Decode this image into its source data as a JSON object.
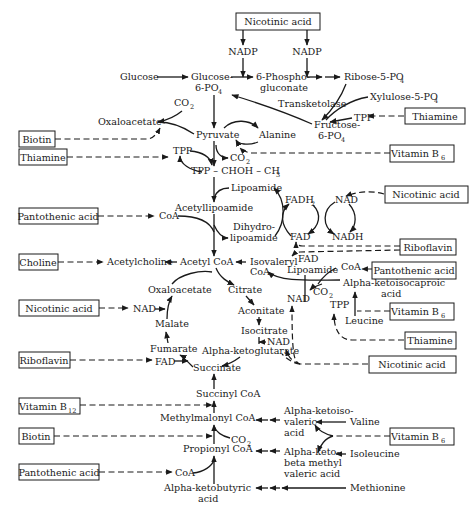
{
  "diagram": {
    "colors": {
      "ink": "#1a1a1a",
      "background": "#ffffff"
    }
  },
  "vitamins": {
    "nicotinic_top": "Nicotinic acid",
    "thiamine_right": "Thiamine",
    "biotin_top": "Biotin",
    "thiamine_left": "Thiamine",
    "vitamin_b6_top": "Vitamin B",
    "vitamin_b6_top_sub": "6",
    "nicotinic_mid": "Nicotinic acid",
    "pantothenic_top": "Pantothenic acid",
    "riboflavin_mid": "Riboflavin",
    "choline": "Choline",
    "pantothenic_right": "Pantothenic acid",
    "nicotinic_left": "Nicotinic acid",
    "vitamin_b6_mid": "Vitamin B",
    "vitamin_b6_mid_sub": "6",
    "thiamine_low": "Thiamine",
    "riboflavin_left": "Riboflavin",
    "nicotinic_low": "Nicotinic acid",
    "vitamin_b12": "Vitamin B",
    "vitamin_b12_sub": "12",
    "biotin_low": "Biotin",
    "vitamin_b6_low": "Vitamin B",
    "vitamin_b6_low_sub": "6",
    "pantothenic_low": "Pantothenic acid"
  },
  "metabolites": {
    "nadp_1": "NADP",
    "nadp_2": "NADP",
    "glucose": "Glucose",
    "glucose6p_1": "Glucose-",
    "glucose6p_2": "6-PO",
    "glucose6p_sub": "4",
    "phosphogluconate_1": "6-Phospho-",
    "phosphogluconate_2": "gluconate",
    "ribose5p": "Ribose-5-PO",
    "ribose5p_sub": "4",
    "xylulose5p": "Xylulose-5-PO",
    "xylulose5p_sub": "4",
    "transketolase": "Transketolase",
    "co2_top": "CO",
    "co2_top_sub": "2",
    "oxaloacetate_top": "Oxaloacetate",
    "tpp_right": "TPP",
    "fructose6p_1": "Fructose-",
    "fructose6p_2": "6-PO",
    "fructose6p_sub": "4",
    "pyruvate": "Pyruvate",
    "alanine": "Alanine",
    "tpp_left": "TPP",
    "co2_pyr": "CO",
    "co2_pyr_sub": "2",
    "tpp_chohch3": "TPP – CHOH – CH",
    "tpp_chohch3_sub": "3",
    "lipoamide_top": "Lipoamide",
    "fadh2": "FADH",
    "fadh2_sub": "2",
    "nad_cycle": "NAD",
    "coa_left": "CoA",
    "acetyllipoamide": "Acetyllipoamide",
    "dihydro_1": "Dihydro-",
    "dihydro_2": "lipoamide",
    "fad_cycle": "FAD",
    "nadh": "NADH",
    "acetylcholine": "Acetylcholine",
    "acetyl_coa": "Acetyl CoA",
    "isovaleryl_1": "Isovaleryl",
    "isovaleryl_2": "CoA",
    "fad_iso": "FAD",
    "lipoamide_iso": "Lipoamide",
    "coa_right": "CoA",
    "alpha_ketoisocaproic_1": "Alpha-ketoisocaproic",
    "alpha_ketoisocaproic_2": "acid",
    "oxaloacetate_tca": "Oxaloacetate",
    "citrate": "Citrate",
    "nad_right": "NAD",
    "co2_iso": "CO",
    "co2_iso_sub": "2",
    "tpp_iso": "TPP",
    "nad_malate": "NAD",
    "aconitate": "Aconitate",
    "leucine": "Leucine",
    "malate": "Malate",
    "isocitrate": "Isocitrate",
    "nad_isocitrate": "NAD",
    "fumarate": "Fumarate",
    "alpha_ketoglutarate": "Alpha-ketoglutarate",
    "fad_succ": "FAD",
    "succinate": "Succinate",
    "succinyl_coa": "Succinyl CoA",
    "methylmalonyl_coa": "Methylmalonyl CoA",
    "alpha_ketoisovaleric_1": "Alpha-ketoiso-",
    "alpha_ketoisovaleric_2": "valeric",
    "alpha_ketoisovaleric_3": "acid",
    "valine": "Valine",
    "co2_prop": "CO",
    "co2_prop_sub": "2",
    "propionyl_coa": "Propionyl CoA",
    "alpha_ketobeta_1": "Alpha-keto-",
    "alpha_ketobeta_2": "beta methyl",
    "alpha_ketobeta_3": "valeric acid",
    "isoleucine": "Isoleucine",
    "coa_low": "CoA",
    "alpha_ketobutyric_1": "Alpha-ketobutyric",
    "alpha_ketobutyric_2": "acid",
    "methionine": "Methionine"
  }
}
